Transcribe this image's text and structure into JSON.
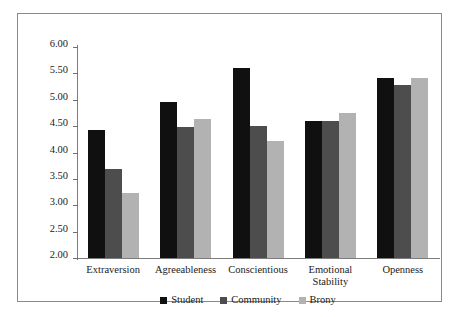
{
  "chart_data": {
    "type": "bar",
    "title": "",
    "subtitle": "",
    "xlabel": "",
    "ylabel": "",
    "ylim": [
      2.0,
      6.0
    ],
    "ytick_step": 0.5,
    "yticks": [
      "6.00",
      "5.50",
      "5.00",
      "4.50",
      "4.00",
      "3.50",
      "3.00",
      "2.50",
      "2.00"
    ],
    "ytick_values": [
      6.0,
      5.5,
      5.0,
      4.5,
      4.0,
      3.5,
      3.0,
      2.5,
      2.0
    ],
    "grid": false,
    "legend_position": "bottom-center",
    "categories": [
      "Extraversion",
      "Agreeableness",
      "Conscientious",
      "Emotional\nStability",
      "Openness"
    ],
    "series": [
      {
        "name": "Student",
        "color": "#101010",
        "values": [
          4.42,
          4.96,
          5.61,
          4.59,
          5.42
        ]
      },
      {
        "name": "Community",
        "color": "#4d4d4d",
        "values": [
          3.69,
          4.48,
          4.51,
          4.59,
          5.28
        ]
      },
      {
        "name": "Brony",
        "color": "#b2b2b2",
        "values": [
          3.23,
          4.64,
          4.22,
          4.75,
          5.42
        ]
      }
    ]
  },
  "legend": {
    "items": [
      {
        "label": "Student",
        "color": "#101010"
      },
      {
        "label": "Community",
        "color": "#4d4d4d"
      },
      {
        "label": "Brony",
        "color": "#b2b2b2"
      }
    ]
  },
  "colors": {
    "student": "#101010",
    "community": "#4d4d4d",
    "brony": "#b2b2b2",
    "axis": "#7d7d7d",
    "frame": "#8a8a8a",
    "text": "#1a1a1a",
    "background": "#ffffff"
  }
}
